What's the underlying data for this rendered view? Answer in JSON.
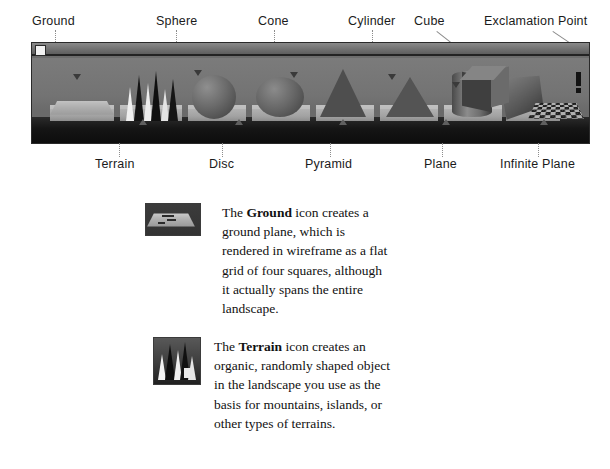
{
  "figure": {
    "window_title": "",
    "close_box": "close-box",
    "top_labels": [
      {
        "text": "Ground",
        "x": 32,
        "leader_x": 55,
        "leader_top": 30,
        "leader_h": 26
      },
      {
        "text": "Sphere",
        "x": 156,
        "leader_x": 176,
        "leader_top": 30,
        "leader_h": 26
      },
      {
        "text": "Cone",
        "x": 258,
        "leader_x": 274,
        "leader_top": 30,
        "leader_h": 26
      },
      {
        "text": "Cylinder",
        "x": 348,
        "leader_x": 372,
        "leader_top": 30,
        "leader_h": 26
      },
      {
        "text": "Cube",
        "x": 414,
        "leader_x": 432,
        "leader_top": 30,
        "leader_h": 26
      },
      {
        "text": "Exclamation Point",
        "x": 484,
        "leader_x": 556,
        "leader_top": 30,
        "leader_h": 26
      }
    ],
    "bottom_labels": [
      {
        "text": "Terrain",
        "x": 95,
        "leader_x": 119,
        "leader_top": 140,
        "leader_h": 17
      },
      {
        "text": "Disc",
        "x": 209,
        "leader_x": 222,
        "leader_top": 140,
        "leader_h": 17
      },
      {
        "text": "Pyramid",
        "x": 305,
        "leader_x": 330,
        "leader_top": 140,
        "leader_h": 17
      },
      {
        "text": "Plane",
        "x": 424,
        "leader_x": 442,
        "leader_top": 140,
        "leader_h": 17
      },
      {
        "text": "Infinite Plane",
        "x": 500,
        "leader_x": 538,
        "leader_top": 140,
        "leader_h": 17
      }
    ]
  },
  "entries": [
    {
      "icon_name": "ground-icon",
      "paragraph_lead": "The ",
      "paragraph_bold": "Ground",
      "paragraph_rest": " icon creates a ground plane, which is rendered in wireframe as a flat grid of four squares, although it actually spans the entire landscape."
    },
    {
      "icon_name": "terrain-icon",
      "paragraph_lead": "The ",
      "paragraph_bold": "Terrain",
      "paragraph_rest": " icon creates an organic, randomly shaped object in the landscape you use as the basis for mountains, islands, or other types of terrains."
    }
  ],
  "colors": {
    "page_background": "#ffffff",
    "titlebar": "#6f6f6f",
    "scene_background": "#737373",
    "foreground_band": "#111111",
    "tile": "#a8a8a8",
    "text": "#111111",
    "leader_line": "#8d8d8d"
  }
}
